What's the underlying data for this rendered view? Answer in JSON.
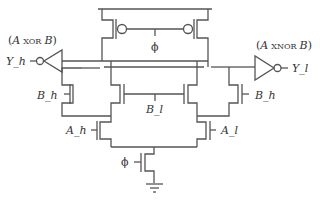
{
  "diagram": {
    "type": "circuit-schematic",
    "colors": {
      "wire": "#555555",
      "text": "#333333",
      "background": "#ffffff"
    },
    "outputs": {
      "left": {
        "signal": "Y_h",
        "function_prefix": "(",
        "function_a": "A",
        "function_op": "XOR",
        "function_b": "B",
        "function_suffix": ")"
      },
      "right": {
        "signal": "Y_l",
        "function_prefix": "(",
        "function_a": "A",
        "function_op": "XNOR",
        "function_b": "B",
        "function_suffix": ")"
      }
    },
    "inputs": {
      "clock_top": "ϕ",
      "clock_bottom": "ϕ",
      "b_h_left": "B_h",
      "b_h_right": "B_h",
      "b_l": "B_l",
      "a_h": "A_h",
      "a_l": "A_l"
    },
    "components": [
      {
        "id": "pmos-left",
        "kind": "pmos",
        "gate": "ϕ"
      },
      {
        "id": "pmos-right",
        "kind": "pmos",
        "gate": "ϕ"
      },
      {
        "id": "inv-left",
        "kind": "inverter",
        "output": "Y_h"
      },
      {
        "id": "inv-right",
        "kind": "inverter",
        "output": "Y_l"
      },
      {
        "id": "nmos-b-h-left",
        "kind": "nmos",
        "gate": "B_h"
      },
      {
        "id": "nmos-b-l-left",
        "kind": "nmos",
        "gate": "B_l"
      },
      {
        "id": "nmos-b-l-right",
        "kind": "nmos",
        "gate": "B_l"
      },
      {
        "id": "nmos-b-h-right",
        "kind": "nmos",
        "gate": "B_h"
      },
      {
        "id": "nmos-a-h",
        "kind": "nmos",
        "gate": "A_h"
      },
      {
        "id": "nmos-a-l",
        "kind": "nmos",
        "gate": "A_l"
      },
      {
        "id": "nmos-clock",
        "kind": "nmos",
        "gate": "ϕ"
      },
      {
        "id": "ground",
        "kind": "ground"
      }
    ]
  }
}
